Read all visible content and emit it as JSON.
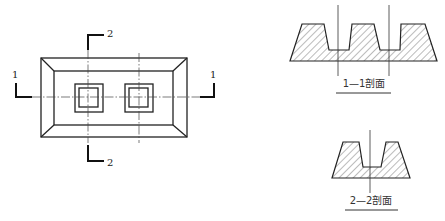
{
  "plan_view": {
    "section_marks": {
      "left_1": "1",
      "right_1": "1",
      "top_2": "2",
      "bottom_2": "2"
    }
  },
  "section_1_1": {
    "caption": "1—1剖面"
  },
  "section_2_2": {
    "caption": "2—2剖面"
  },
  "colors": {
    "line": "#222222",
    "background": "#ffffff"
  }
}
